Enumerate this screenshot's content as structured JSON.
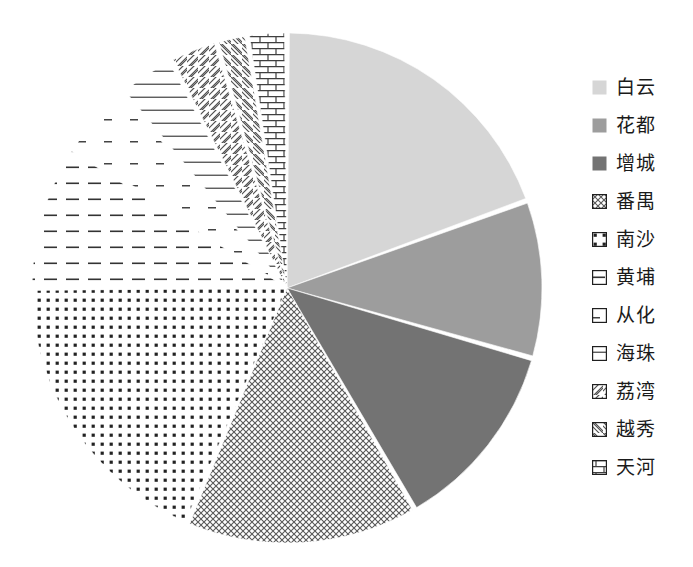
{
  "chart_data": {
    "type": "pie",
    "title": "",
    "xlabel": "",
    "ylabel": "",
    "legend_position": "right",
    "grid": false,
    "start_angle_deg": 0,
    "direction": "clockwise",
    "categories": [
      "白云",
      "花都",
      "增城",
      "番禺",
      "南沙",
      "黄埔",
      "从化",
      "海珠",
      "荔湾",
      "越秀",
      "天河"
    ],
    "values": [
      19.4,
      10.0,
      12.2,
      14.7,
      18.6,
      9.2,
      4.7,
      3.6,
      3.0,
      2.1,
      2.5
    ],
    "slices": [
      {
        "label": "白云",
        "value": 19.4,
        "start_deg": 0,
        "end_deg": 70,
        "pattern": "solid-light-gray",
        "color": "#d4d4d4"
      },
      {
        "label": "花都",
        "value": 10.0,
        "start_deg": 70,
        "end_deg": 106,
        "pattern": "solid-medium-gray",
        "color": "#9a9a9a"
      },
      {
        "label": "增城",
        "value": 12.2,
        "start_deg": 106,
        "end_deg": 150,
        "pattern": "solid-dark-gray",
        "color": "#6e6e6e"
      },
      {
        "label": "番禺",
        "value": 14.7,
        "start_deg": 150,
        "end_deg": 203,
        "pattern": "crosshatch",
        "color": "#595959"
      },
      {
        "label": "南沙",
        "value": 18.6,
        "start_deg": 203,
        "end_deg": 270,
        "pattern": "dots",
        "color": "#2b2b2b"
      },
      {
        "label": "黄埔",
        "value": 9.2,
        "start_deg": 270,
        "end_deg": 303,
        "pattern": "horizontal-dashes",
        "color": "#3a3a3a"
      },
      {
        "label": "从化",
        "value": 4.7,
        "start_deg": 303,
        "end_deg": 320,
        "pattern": "sparse-dashes",
        "color": "#4a4a4a"
      },
      {
        "label": "海珠",
        "value": 3.6,
        "start_deg": 320,
        "end_deg": 333,
        "pattern": "horizontal-lines",
        "color": "#555555"
      },
      {
        "label": "荔湾",
        "value": 3.0,
        "start_deg": 333,
        "end_deg": 344,
        "pattern": "diagonal-backslash",
        "color": "#555555"
      },
      {
        "label": "越秀",
        "value": 2.1,
        "start_deg": 344,
        "end_deg": 351,
        "pattern": "diagonal-slash",
        "color": "#555555"
      },
      {
        "label": "天河",
        "value": 2.5,
        "start_deg": 351,
        "end_deg": 360,
        "pattern": "brick",
        "color": "#4a4a4a"
      }
    ],
    "geometry": {
      "center_x": 287,
      "center_y": 288,
      "radius": 255,
      "gap_deg": 1.1
    }
  },
  "legend": {
    "items": [
      {
        "label": "白云",
        "swatch": "swatch-solid-light"
      },
      {
        "label": "花都",
        "swatch": "swatch-solid-medium"
      },
      {
        "label": "增城",
        "swatch": "swatch-solid-dark"
      },
      {
        "label": "番禺",
        "swatch": "swatch-crosshatch"
      },
      {
        "label": "南沙",
        "swatch": "swatch-dots"
      },
      {
        "label": "黄埔",
        "swatch": "swatch-horizontal-dashes"
      },
      {
        "label": "从化",
        "swatch": "swatch-sparse-dashes"
      },
      {
        "label": "海珠",
        "swatch": "swatch-horizontal-lines"
      },
      {
        "label": "荔湾",
        "swatch": "swatch-diagonal-backslash"
      },
      {
        "label": "越秀",
        "swatch": "swatch-diagonal-slash"
      },
      {
        "label": "天河",
        "swatch": "swatch-brick"
      }
    ]
  }
}
